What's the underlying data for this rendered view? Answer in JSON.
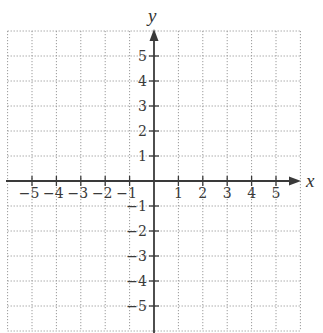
{
  "chart_data": {
    "type": "coordinate-grid",
    "title": "",
    "xlabel": "x",
    "ylabel": "y",
    "xlim": [
      -6,
      6
    ],
    "ylim": [
      -6,
      6
    ],
    "grid": true,
    "grid_style": "dotted",
    "x_ticks": [
      -5,
      -4,
      -3,
      -2,
      -1,
      1,
      2,
      3,
      4,
      5
    ],
    "y_ticks": [
      5,
      4,
      3,
      2,
      1,
      -1,
      -2,
      -3,
      -4,
      -5
    ],
    "x_tick_labels": [
      "−5",
      "−4",
      "−3",
      "−2",
      "−1",
      "1",
      "2",
      "3",
      "4",
      "5"
    ],
    "y_tick_labels": [
      "5",
      "4",
      "3",
      "2",
      "1",
      "−1",
      "−2",
      "−3",
      "−4",
      "−5"
    ],
    "series": []
  },
  "axes": {
    "x_label": "x",
    "y_label": "y"
  },
  "colors": {
    "axis": "#3a3a3a",
    "grid": "#9a9a9a",
    "background": "#ffffff"
  }
}
